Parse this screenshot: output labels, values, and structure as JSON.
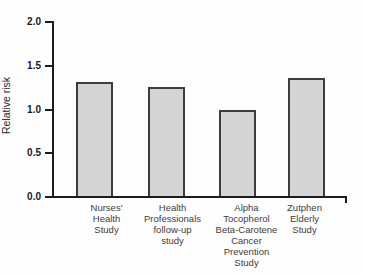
{
  "chart_data": {
    "type": "bar",
    "title": "",
    "ylabel": "Relative risk",
    "xlabel": "",
    "ylim": [
      0,
      2
    ],
    "yticks": [
      2.0,
      1.5,
      1.0,
      0.5,
      0.0
    ],
    "ytick_format_decimals": 1,
    "categories": [
      "Nurses'\nHealth\nStudy",
      "Health\nProfessionals\nfollow-up\nstudy",
      "Alpha\nTocopherol\nBeta-Carotene\nCancer\nPrevention\nStudy",
      "Zutphen\nElderly\nStudy"
    ],
    "values": [
      1.3,
      1.25,
      0.98,
      1.35
    ],
    "grid": false,
    "legend": "none",
    "colors": {
      "bar_fill": "#d4d4d4",
      "bar_border": "#3c3c3c",
      "axis": "#1c1c1c",
      "tick_text": "#1a1a1a",
      "category_text": "#3d3d3d",
      "background": "#fdfdfd"
    }
  }
}
